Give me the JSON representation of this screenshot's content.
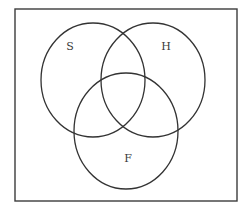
{
  "diagram": {
    "type": "venn",
    "universe": {
      "label": "",
      "x": 15,
      "y": 9,
      "width": 222,
      "height": 192,
      "stroke": "#3c3c3c"
    },
    "sets": [
      {
        "id": "S",
        "label": "S",
        "cx": 93,
        "cy": 80,
        "rx": 52,
        "ry": 57,
        "label_x": 70,
        "label_y": 50
      },
      {
        "id": "H",
        "label": "H",
        "cx": 153,
        "cy": 80,
        "rx": 52,
        "ry": 57,
        "label_x": 166,
        "label_y": 50
      },
      {
        "id": "F",
        "label": "F",
        "cx": 126,
        "cy": 131,
        "rx": 52,
        "ry": 58,
        "label_x": 128,
        "label_y": 162
      }
    ],
    "stroke_color": "#333333",
    "background": "#ffffff"
  }
}
